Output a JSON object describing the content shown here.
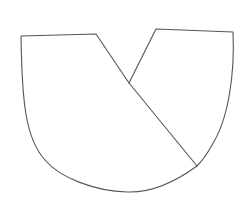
{
  "canvas": {
    "width": 249,
    "height": 205,
    "background": "#ffffff"
  },
  "style": {
    "stroke": "#555555",
    "stroke_width": 1.1
  },
  "shapes": [
    {
      "name": "left-sector-shape",
      "path": "M 21 36 L 96 34 L 129 83 L 197 166 C 175 182, 150 193, 127 192 C 95 191, 60 178, 45 160 C 25 138, 22 100, 21 36 Z"
    },
    {
      "name": "right-sector-shape",
      "path": "M 129 83 L 156 29 L 233 32 C 235 75, 228 120, 212 145 C 206 156, 201 162, 197 166"
    }
  ]
}
